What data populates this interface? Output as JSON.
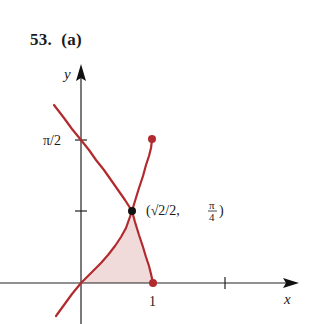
{
  "heading": {
    "problem_number": "53.",
    "part": "(a)"
  },
  "colors": {
    "curve": "#b22a2e",
    "fill": "#f1dada",
    "axis": "#222222",
    "point": "#111111"
  },
  "axes": {
    "x_label": "x",
    "y_label": "y",
    "x_ticks": [
      {
        "value": 1,
        "label": "1"
      },
      {
        "value": 2,
        "label": ""
      }
    ],
    "y_ticks": [
      {
        "value": "π/4",
        "label": ""
      },
      {
        "value": "π/2",
        "label": "π/2"
      }
    ]
  },
  "curves": [
    {
      "name": "y = arcsin x",
      "endpoint": [
        1,
        "π/2"
      ]
    },
    {
      "name": "y = arccos x",
      "endpoint": [
        1,
        0
      ]
    }
  ],
  "intersection": {
    "label_main": "(√2/2, ",
    "label_frac_num": "π",
    "label_frac_den": "4",
    "label_close": ")"
  },
  "shaded_region": "region between y = arcsin x, y = arccos x and x-axis from 0 to 1"
}
